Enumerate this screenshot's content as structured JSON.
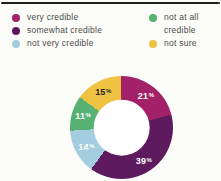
{
  "page": {
    "background": "#fcfcf8",
    "rule_color": "#1f1f1f"
  },
  "legend": {
    "text_color": "#4b4b4b",
    "columns": [
      {
        "items": [
          {
            "label": "very credible",
            "color": "#a22168"
          },
          {
            "label": "somewhat credible",
            "color": "#5e1a5f"
          },
          {
            "label": "not very credible",
            "color": "#a5cde0"
          }
        ]
      },
      {
        "items": [
          {
            "label": "not at all credible",
            "color": "#57b173"
          },
          {
            "label": "not sure",
            "color": "#edc341"
          }
        ]
      }
    ]
  },
  "chart_data": {
    "type": "pie",
    "subtype": "donut",
    "unit": "%",
    "rotation": "clockwise-from-top",
    "legend_position": "top",
    "inner_radius_ratio": 0.55,
    "hole_color": "#ffffff",
    "segments": [
      {
        "label": "very credible",
        "value": 21,
        "color": "#a22168",
        "label_color": "#ffffff"
      },
      {
        "label": "somewhat credible",
        "value": 39,
        "color": "#5e1a5f",
        "label_color": "#ffffff"
      },
      {
        "label": "not very credible",
        "value": 14,
        "color": "#a5cde0",
        "label_color": "#ffffff"
      },
      {
        "label": "not at all credible",
        "value": 11,
        "color": "#57b173",
        "label_color": "#ffffff"
      },
      {
        "label": "not sure",
        "value": 15,
        "color": "#edc341",
        "label_color": "#2d2430"
      }
    ]
  }
}
